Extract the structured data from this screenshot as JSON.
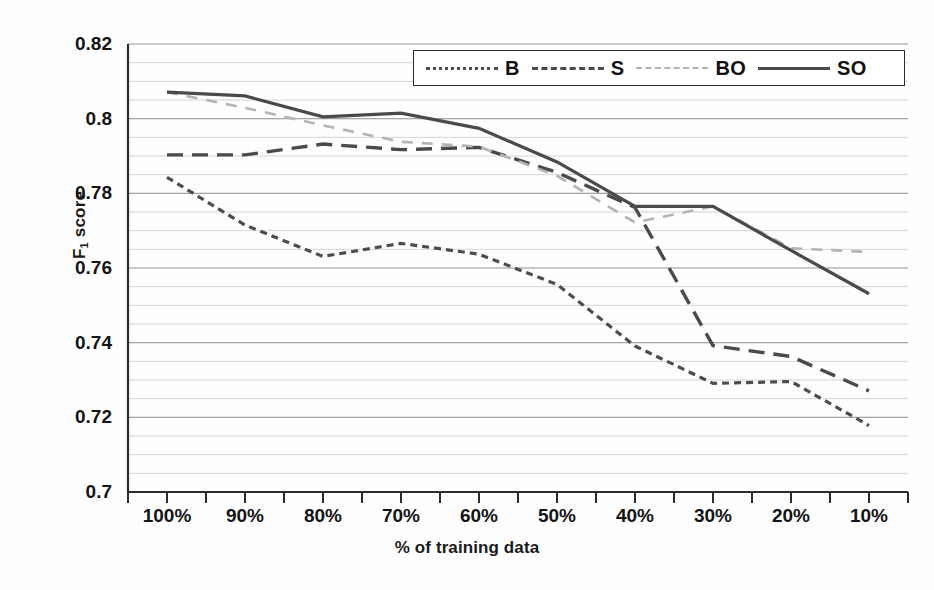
{
  "chart_data": {
    "type": "line",
    "title": "",
    "xlabel": "% of training data",
    "ylabel": "F1 score",
    "ylabel_main": "F",
    "ylabel_sub": "1",
    "ylabel_rest": " score",
    "categories": [
      "100%",
      "90%",
      "80%",
      "70%",
      "60%",
      "50%",
      "40%",
      "30%",
      "20%",
      "10%"
    ],
    "ylim": [
      0.7,
      0.82
    ],
    "yticks": [
      0.82,
      0.8,
      0.78,
      0.76,
      0.74,
      0.72,
      0.7
    ],
    "ytick_labels": [
      "0.82",
      "0.8",
      "0.78",
      "0.76",
      "0.74",
      "0.72",
      "0.7"
    ],
    "minor_gridline_step": 0.005,
    "grid": true,
    "legend_position": "top-right",
    "series": [
      {
        "name": "B",
        "style": "dotted",
        "color": "#4d4d4d",
        "values": [
          0.7843,
          0.7715,
          0.7631,
          0.7666,
          0.7637,
          0.7556,
          0.7391,
          0.7291,
          0.7296,
          0.7178
        ]
      },
      {
        "name": "S",
        "style": "dashed",
        "color": "#4a4a4a",
        "values": [
          0.7903,
          0.7903,
          0.7932,
          0.7917,
          0.7923,
          0.7856,
          0.7762,
          0.7392,
          0.7363,
          0.7271
        ]
      },
      {
        "name": "BO",
        "style": "dashed-light",
        "color": "#b3b3b3",
        "values": [
          0.8071,
          0.8029,
          0.7982,
          0.7938,
          0.7925,
          0.7847,
          0.7722,
          0.7765,
          0.7653,
          0.7643
        ]
      },
      {
        "name": "SO",
        "style": "solid",
        "color": "#4a4a4a",
        "values": [
          0.8071,
          0.8061,
          0.8005,
          0.8015,
          0.7974,
          0.7884,
          0.7765,
          0.7765,
          0.7647,
          0.7531
        ]
      }
    ]
  },
  "legend": {
    "entries": [
      {
        "label": "B",
        "key": "dotted-line-key"
      },
      {
        "label": "S",
        "key": "dashed-line-key"
      },
      {
        "label": "BO",
        "key": "light-dashed-line-key"
      },
      {
        "label": "SO",
        "key": "solid-line-key"
      }
    ]
  }
}
